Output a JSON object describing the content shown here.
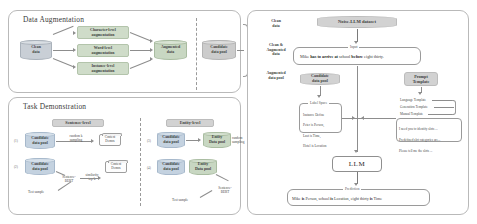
{
  "figure": {
    "panels": {
      "augmentation": {
        "title": "Data Augmentation",
        "source": "Clean\ndata",
        "methods": [
          "Character-level\naugmentation",
          "Word-level\naugmentation",
          "Instance-level\naugmentation"
        ],
        "augmented": "Augmented\ndata",
        "candidate_pool": "Candidate\ndata pool",
        "outputs": [
          {
            "index": "(1)",
            "label": "Clean\ndata"
          },
          {
            "index": "(2)",
            "label": "Clean &\nAugmented\ndata"
          },
          {
            "index": "(3)",
            "label": "Augmented\ndata pool"
          }
        ]
      },
      "task_demonstration": {
        "title": "Task Demonstration",
        "groups": [
          {
            "heading": "Sentence-level",
            "rows": [
              {
                "index": "(1)",
                "source": "Candidate\ndata pool",
                "op": "random k\nsampling",
                "target": "Context\nDemos"
              },
              {
                "index": "(2)",
                "source": "Candidate\ndata pool",
                "op": "Sentence-\nBERT",
                "op2": "similarity\ntop-k",
                "target": "Context\nDemos"
              }
            ],
            "test_sample": "Test sample"
          },
          {
            "heading": "Entity-level",
            "rows": [
              {
                "index": "(3)",
                "source": "Candidate\ndata pool",
                "op": "",
                "target": "Entity\nData pool",
                "tail": "random\nsampling"
              },
              {
                "index": "(4)",
                "source": "Candidate\ndata pool",
                "op": "",
                "target": "Entity\nData pool",
                "tail": "Sentence-\nBERT"
              }
            ],
            "test_sample": "Test sample"
          }
        ]
      },
      "llm_pipeline": {
        "dataset": "Noise-LLM dataset",
        "input_label": "Input",
        "input_sentence_parts": [
          {
            "text": "Mike ",
            "bold": false
          },
          {
            "text": "has to arrive at",
            "bold": true
          },
          {
            "text": " school ",
            "bold": false
          },
          {
            "text": "before",
            "bold": true
          },
          {
            "text": " eight thirty.",
            "bold": false
          }
        ],
        "candidate_pool": "Candidate\ndata pool",
        "label_space_title": "Label Space",
        "label_space_lines": [
          "Instance Define",
          "Peter is Person,",
          "Last is Time,",
          "Hotel is Location"
        ],
        "prompt_template_title": "Prompt\nTemplate",
        "template_options": [
          "Language Template",
          "Generation Template",
          "Manual Template"
        ],
        "prompt_lines": [
          "I need you to identify slots ...",
          "Predefined slot categories are...",
          "Please tell me the slots ..."
        ],
        "llm_label": "LLM",
        "prediction_label": "Prediction",
        "prediction_parts": [
          {
            "text": "Mike ",
            "bold": false
          },
          {
            "text": "is",
            "bold": true
          },
          {
            "text": " Person, school ",
            "bold": false
          },
          {
            "text": "is",
            "bold": true
          },
          {
            "text": " Location, eight thirty ",
            "bold": false
          },
          {
            "text": "is",
            "bold": true
          },
          {
            "text": " Time",
            "bold": false
          }
        ]
      }
    }
  }
}
